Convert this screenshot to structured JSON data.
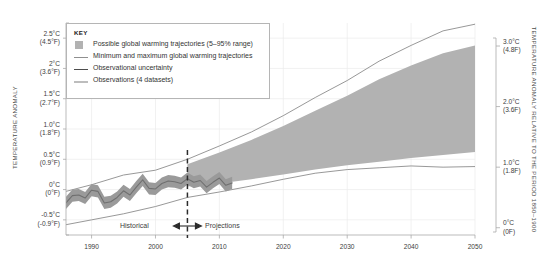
{
  "chart_data": {
    "type": "area",
    "title": "",
    "subtitle": "",
    "xlabel": "",
    "ylabel": "TEMPERATURE ANOMALY",
    "ylabel_right": "TEMPERATURE ANOMALY RELATIVE TO THE PERIOD 1850–1900",
    "grid": true,
    "legend_position": "top-left",
    "xlim": [
      1986,
      2050
    ],
    "ylim": [
      -0.75,
      2.75
    ],
    "x_ticks": [
      1990,
      2000,
      2010,
      2020,
      2030,
      2040,
      2050
    ],
    "x_tick_labels": [
      "1990",
      "2000",
      "2010",
      "2020",
      "2030",
      "2040",
      "2050"
    ],
    "y_ticks_left": [
      -0.5,
      0,
      0.5,
      1.0,
      1.5,
      2.0,
      2.5
    ],
    "y_tick_labels_left": [
      {
        "c": "-0.5°C",
        "f": "(-0.9°F)"
      },
      {
        "c": "0°C",
        "f": "(0°F)"
      },
      {
        "c": "0.5°C",
        "f": "(0.9°F)"
      },
      {
        "c": "1.0°C",
        "f": "(1.8°F)"
      },
      {
        "c": "1.5°C",
        "f": "(2.7°F)"
      },
      {
        "c": "2°C",
        "f": "(3.6°F)"
      },
      {
        "c": "2.5°C",
        "f": "(4.5°F)"
      }
    ],
    "y_ticks_right": [
      0,
      1.0,
      2.0,
      3.0
    ],
    "y_tick_labels_right": [
      {
        "c": "0°C",
        "f": "(0F)"
      },
      {
        "c": "1.0°C",
        "f": "(1.8F)"
      },
      {
        "c": "2.0°C",
        "f": "(3.6F)"
      },
      {
        "c": "3.0°C",
        "f": "(4.8F)"
      }
    ],
    "right_axis_offset_c": 0.63,
    "divider_year": 2005,
    "annotations": [
      {
        "name": "historical",
        "label": "Historical",
        "x": 2001
      },
      {
        "name": "projections",
        "label": "Projections",
        "x": 2009
      }
    ],
    "series": [
      {
        "name": "Observations (4 datasets)",
        "type": "line",
        "color": "#a8a8a8",
        "x": [
          1986,
          1987,
          1988,
          1989,
          1990,
          1991,
          1992,
          1993,
          1994,
          1995,
          1996,
          1997,
          1998,
          1999,
          2000,
          2001,
          2002,
          2003,
          2004,
          2005,
          2006,
          2007,
          2008,
          2009,
          2010,
          2011,
          2012
        ],
        "values": [
          -0.22,
          -0.1,
          -0.09,
          -0.14,
          -0.01,
          -0.03,
          -0.22,
          -0.2,
          -0.13,
          -0.02,
          -0.09,
          0.04,
          0.16,
          0.02,
          0.01,
          0.1,
          0.14,
          0.13,
          0.1,
          0.18,
          0.12,
          0.15,
          0.04,
          0.12,
          0.19,
          0.07,
          0.11
        ]
      },
      {
        "name": "Observational uncertainty",
        "type": "band",
        "color": "#9a9a9a",
        "x": [
          1986,
          1987,
          1988,
          1989,
          1990,
          1991,
          1992,
          1993,
          1994,
          1995,
          1996,
          1997,
          1998,
          1999,
          2000,
          2001,
          2002,
          2003,
          2004,
          2005,
          2006,
          2007,
          2008,
          2009,
          2010,
          2011,
          2012
        ],
        "lower": [
          -0.32,
          -0.2,
          -0.19,
          -0.24,
          -0.11,
          -0.13,
          -0.32,
          -0.3,
          -0.23,
          -0.12,
          -0.19,
          -0.06,
          0.06,
          -0.08,
          -0.09,
          0.0,
          0.04,
          0.03,
          0.0,
          0.08,
          0.02,
          0.05,
          -0.06,
          0.02,
          0.09,
          -0.03,
          0.01
        ],
        "upper": [
          -0.12,
          0.0,
          0.01,
          -0.04,
          0.09,
          0.07,
          -0.12,
          -0.1,
          -0.03,
          0.08,
          0.01,
          0.14,
          0.26,
          0.12,
          0.11,
          0.2,
          0.24,
          0.23,
          0.2,
          0.28,
          0.22,
          0.25,
          0.14,
          0.22,
          0.29,
          0.17,
          0.21
        ]
      },
      {
        "name": "Minimum and maximum global warming trajectories",
        "type": "envelope",
        "color": "#8c8c8c",
        "x": [
          1986,
          1990,
          1995,
          2000,
          2005,
          2010,
          2015,
          2020,
          2025,
          2030,
          2035,
          2040,
          2045,
          2050
        ],
        "min": [
          -0.58,
          -0.5,
          -0.4,
          -0.28,
          -0.13,
          -0.04,
          0.06,
          0.17,
          0.27,
          0.33,
          0.36,
          0.39,
          0.37,
          0.38
        ],
        "max": [
          -0.03,
          0.08,
          0.24,
          0.32,
          0.5,
          0.72,
          0.95,
          1.22,
          1.52,
          1.8,
          2.12,
          2.38,
          2.62,
          2.73
        ]
      },
      {
        "name": "Possible global warming trajectories (5–95% range)",
        "type": "band",
        "color": "#b2b2b2",
        "x": [
          2005,
          2010,
          2015,
          2020,
          2025,
          2030,
          2035,
          2040,
          2045,
          2050
        ],
        "lower": [
          0.05,
          0.1,
          0.17,
          0.25,
          0.33,
          0.4,
          0.46,
          0.52,
          0.57,
          0.62
        ],
        "upper": [
          0.42,
          0.61,
          0.82,
          1.05,
          1.3,
          1.55,
          1.82,
          2.05,
          2.25,
          2.38
        ]
      }
    ]
  },
  "legend": {
    "title": "KEY",
    "items": [
      {
        "mark": "swatch",
        "label": "Possible global warming trajectories (5–95% range)"
      },
      {
        "mark": "line-thin",
        "label": "Minimum and maximum global warming trajectories"
      },
      {
        "mark": "line-dark",
        "label": "Observational uncertainty"
      },
      {
        "mark": "line-light",
        "label": "Observations (4 datasets)"
      }
    ]
  },
  "colors": {
    "projection_band": "#b2b2b2",
    "envelope_line": "#8c8c8c",
    "observation_line": "#a8a8a8",
    "uncertainty_band": "#9a9a9a",
    "grid": "#e9e9e9",
    "axis": "#9c9c9c",
    "text": "#3d3d3d",
    "divider": "#2b2b2b"
  }
}
